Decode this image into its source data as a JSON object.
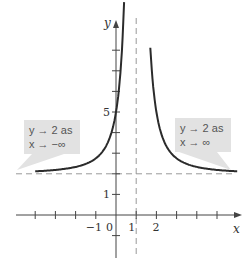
{
  "chart_data": {
    "type": "line",
    "title": "",
    "xlabel": "x",
    "ylabel": "y",
    "xlim": [
      -4.0,
      6.0
    ],
    "ylim": [
      -1.5,
      9.3
    ],
    "function": "y = 2 + 3/(x-1)^2",
    "series": [
      {
        "name": "curve-left-branch",
        "x": [
          -4.0,
          -3.0,
          -2.0,
          -1.0,
          -0.5,
          0.0,
          0.2,
          0.4
        ],
        "y": [
          2.12,
          2.19,
          2.33,
          2.75,
          3.33,
          5.0,
          6.69,
          9.0
        ]
      },
      {
        "name": "curve-right-branch",
        "x": [
          1.7,
          2.0,
          2.5,
          3.0,
          4.0,
          5.0,
          6.0
        ],
        "y": [
          8.12,
          5.0,
          3.33,
          2.75,
          2.33,
          2.19,
          2.12
        ]
      }
    ],
    "asymptotes": [
      {
        "type": "horizontal",
        "value": 2
      },
      {
        "type": "vertical",
        "value": 1
      }
    ],
    "x_ticks": [
      -4,
      -3,
      -2,
      -1,
      0,
      1,
      2,
      3,
      4,
      5
    ],
    "x_tick_labels": [
      {
        "value": -1,
        "label": "-1"
      },
      {
        "value": 0,
        "label": "0"
      },
      {
        "value": 1,
        "label": "1"
      },
      {
        "value": 2,
        "label": "2"
      }
    ],
    "y_ticks": [
      -1,
      1,
      2,
      3,
      4,
      5,
      6,
      7,
      8
    ],
    "y_tick_labels": [
      {
        "value": 1,
        "label": "1"
      },
      {
        "value": 5,
        "label": "5"
      }
    ],
    "annotations": [
      {
        "name": "left-callout",
        "lines": [
          "y → 2 as",
          "x → −∞"
        ],
        "anchor": "left-tail"
      },
      {
        "name": "right-callout",
        "lines": [
          "y → 2 as",
          "x → ∞"
        ],
        "anchor": "right-tail"
      }
    ],
    "grid": false,
    "legend": "none"
  },
  "colors": {
    "curve": "#2b2b2b",
    "axis": "#444444",
    "asymptote": "#999999",
    "callout_bg": "#e2e2e2",
    "callout_text": "#555555"
  }
}
